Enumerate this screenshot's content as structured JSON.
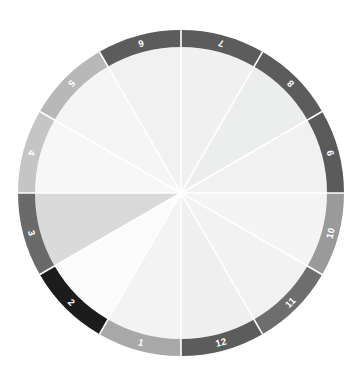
{
  "figure": {
    "title": "",
    "background": "#ffffff",
    "center_x": 181,
    "center_y": 193,
    "outer_radius": 163,
    "inner_radius": 146,
    "spoke_color": "#ffffff",
    "label_color": "#ffffff"
  },
  "chart_data": {
    "type": "pie",
    "title": "",
    "subtitle": "",
    "xlabel": "",
    "ylabel": "",
    "legend_position": "none",
    "grid": false,
    "slice_count": 12,
    "slice_angle_deg": 30,
    "start_angle_deg": 0,
    "direction": "clockwise",
    "categories": [
      "1",
      "2",
      "3",
      "4",
      "5",
      "6",
      "7",
      "8",
      "9",
      "10",
      "11",
      "12"
    ],
    "values": [
      30,
      30,
      30,
      30,
      30,
      30,
      30,
      30,
      30,
      30,
      30,
      30
    ],
    "series": [
      {
        "name": "outer-ring",
        "labels": [
          "1",
          "2",
          "3",
          "4",
          "5",
          "6",
          "7",
          "8",
          "9",
          "10",
          "11",
          "12"
        ],
        "colors": [
          "#5c5c5c",
          "#5c5c5c",
          "#5a5a5a",
          "#9a9a9a",
          "#6e6e6e",
          "#5c5c5c",
          "#a8a8a8",
          "#1c1c1c",
          "#6a6a6a",
          "#c5c5c5",
          "#b8b8b8",
          "#5c5c5c"
        ],
        "label_angles_deg": [
          195,
          225,
          255,
          285,
          315,
          345,
          15,
          45,
          75,
          105,
          135,
          165
        ]
      },
      {
        "name": "inner-pie",
        "colors": [
          "#eff0ef",
          "#eceded",
          "#f0f1f0",
          "#f3f4f3",
          "#f1f2f1",
          "#eeefee",
          "#f2f3f2",
          "#fbfbfb",
          "#d9dad9",
          "#f6f7f6",
          "#f4f5f4",
          "#f0f1f0"
        ],
        "angles_deg": [
          195,
          225,
          255,
          285,
          315,
          345,
          15,
          45,
          75,
          105,
          135,
          165
        ]
      }
    ],
    "annotations": [
      {
        "text": "1",
        "ring_index": 0
      },
      {
        "text": "2",
        "ring_index": 1
      },
      {
        "text": "3",
        "ring_index": 2
      },
      {
        "text": "4",
        "ring_index": 3
      },
      {
        "text": "5",
        "ring_index": 4
      },
      {
        "text": "6",
        "ring_index": 5
      },
      {
        "text": "7",
        "ring_index": 6
      },
      {
        "text": "8",
        "ring_index": 7
      },
      {
        "text": "9",
        "ring_index": 8
      },
      {
        "text": "10",
        "ring_index": 9
      },
      {
        "text": "11",
        "ring_index": 10
      },
      {
        "text": "12",
        "ring_index": 11
      }
    ]
  }
}
